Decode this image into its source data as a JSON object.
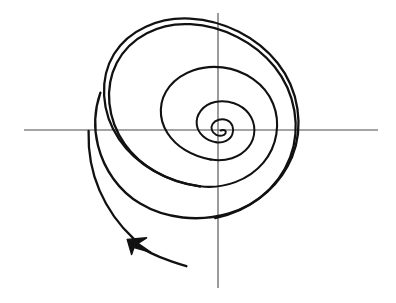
{
  "figure": {
    "title": "Hand-drawn outward spiral with coordinate axes",
    "background_color": "#ffffff",
    "width": 396,
    "height": 303
  },
  "colors": {
    "axis": "#4a4a4a",
    "curve": "#111111",
    "arrow": "#111111",
    "background": "#ffffff"
  },
  "strokes": {
    "axis_width": 1.1,
    "curve_width": 2.0,
    "curve_width_outer": 2.4
  },
  "chart_data": {
    "type": "line",
    "title": "Hand-drawn outward spiral with coordinate axes",
    "xlabel": "",
    "ylabel": "",
    "grid": false,
    "legend": null,
    "origin": {
      "x": 218,
      "y": 130
    },
    "axes": {
      "x_axis": {
        "label": "",
        "y": 130,
        "x_start": 24,
        "x_end": 378
      },
      "y_axis": {
        "label": "",
        "x": 218,
        "y_start": 13,
        "y_end": 288
      }
    },
    "annotations": [
      {
        "name": "direction-arrowhead",
        "type": "arrowhead",
        "tip": {
          "x": 128,
          "y": 240
        },
        "points_toward": "up-left",
        "meaning": "direction of the spiral's outward travel"
      }
    ],
    "series": [
      {
        "name": "spiral",
        "kind": "archimedean-spiral-freehand",
        "turns": 3.4,
        "direction": "counterclockwise-outward",
        "crossings": {
          "positive_x_axis": [
            231,
            262,
            311
          ],
          "negative_x_axis": [
            207,
            155,
            88
          ],
          "positive_y_axis": [
            119,
            93,
            40
          ],
          "negative_y_axis": [
            141,
            152,
            187
          ]
        },
        "extents": {
          "inner_loop": {
            "left": 208,
            "right": 232,
            "top": 118,
            "bottom": 142
          },
          "middle_loop": {
            "left": 155,
            "right": 262,
            "top": 93,
            "bottom": 152
          },
          "outer_loop": {
            "left": 88,
            "right": 311,
            "top": 40,
            "bottom": 187
          }
        },
        "tail_end": {
          "x": 186,
          "y": 266
        }
      }
    ]
  }
}
